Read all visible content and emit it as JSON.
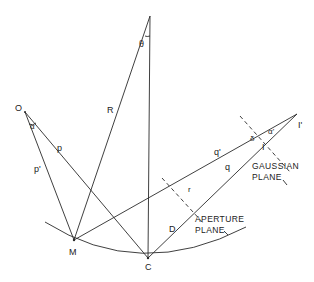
{
  "diagram": {
    "type": "optical geometry (spherical mirror aberration)",
    "points": {
      "apex": {
        "label": "",
        "x": 150,
        "y": 16
      },
      "O": {
        "label": "O",
        "x": 25,
        "y": 112
      },
      "M": {
        "label": "M",
        "x": 74,
        "y": 240
      },
      "C": {
        "label": "C",
        "x": 148,
        "y": 258
      },
      "I_prime": {
        "label": "I'",
        "x": 297,
        "y": 114
      },
      "I": {
        "label": "I",
        "x": 262,
        "y": 143
      }
    },
    "labels": {
      "theta": "θ",
      "R": "R",
      "O": "O",
      "alpha_left": "α",
      "p": "p",
      "p_prime": "p'",
      "M": "M",
      "C": "C",
      "q_prime": "q'",
      "q": "q",
      "r": "r",
      "D": "D",
      "delta": "δ",
      "alpha_right": "α'",
      "I": "I",
      "I_prime": "I'",
      "gaussian_plane_line1": "GAUSSIAN",
      "gaussian_plane_line2": "PLANE",
      "aperture_plane_line1": "APERTURE",
      "aperture_plane_line2": "PLANE"
    },
    "colors": {
      "line": "#2a2a2a",
      "background": "#ffffff"
    }
  }
}
